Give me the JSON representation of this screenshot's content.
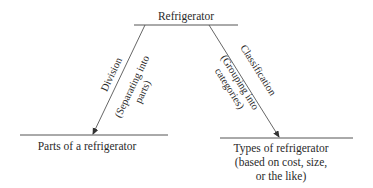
{
  "diagram": {
    "root": {
      "label": "Refrigerator"
    },
    "left_edge": {
      "label": "Division",
      "sublabel_line1": "(Separating into",
      "sublabel_line2": "parts)"
    },
    "right_edge": {
      "label": "Classification",
      "sublabel_line1": "(Grouping into",
      "sublabel_line2": "categories)"
    },
    "left_node": {
      "label": "Parts of a refrigerator"
    },
    "right_node": {
      "line1": "Types of refrigerator",
      "line2": "(based on cost, size,",
      "line3": "or the like)"
    },
    "colors": {
      "line": "#555555",
      "text": "#2a2a2a"
    }
  }
}
